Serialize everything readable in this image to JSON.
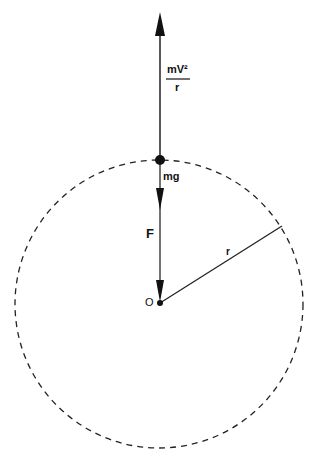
{
  "diagram": {
    "labels": {
      "centripetal_numerator": "mV²",
      "centripetal_denominator": "r",
      "weight": "mg",
      "force": "F",
      "radius": "r",
      "center": "O"
    },
    "geometry": {
      "center": [
        160,
        303
      ],
      "radius_px": 144,
      "top_point": [
        160,
        160
      ],
      "radius_end": [
        282,
        226
      ]
    },
    "colors": {
      "stroke": "#111111",
      "background": "#ffffff"
    }
  }
}
